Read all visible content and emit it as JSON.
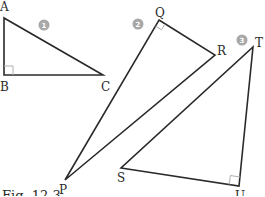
{
  "figure": {
    "caption": "Fig. 12.3",
    "colors": {
      "line": "#2a2a2a",
      "right_angle_marker": "#b0b0b0",
      "badge": "#a8a8a8",
      "badge_text": "#ffffff"
    },
    "triangles": [
      {
        "number": "1",
        "vertices": [
          "A",
          "B",
          "C"
        ],
        "right_angle_at": "B",
        "labels": {
          "A": "A",
          "B": "B",
          "C": "C"
        }
      },
      {
        "number": "2",
        "vertices": [
          "P",
          "Q",
          "R"
        ],
        "right_angle_at": "Q",
        "labels": {
          "P": "P",
          "Q": "Q",
          "R": "R"
        }
      },
      {
        "number": "3",
        "vertices": [
          "S",
          "T",
          "U"
        ],
        "right_angle_at": "U",
        "labels": {
          "S": "S",
          "T": "T",
          "U": "U"
        }
      }
    ]
  }
}
